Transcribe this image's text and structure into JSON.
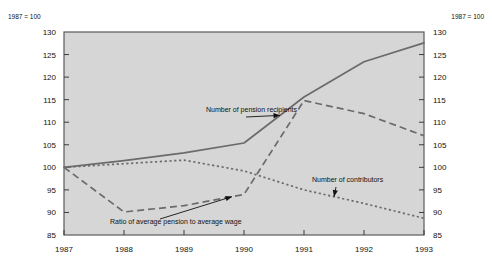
{
  "chart_data": {
    "type": "line",
    "title": "",
    "subtitle": "",
    "xlabel": "",
    "ylabel": "",
    "note_left": "1987 = 100",
    "note_right": "1987 = 100",
    "categories": [
      "1987",
      "1988",
      "1989",
      "1990",
      "1991",
      "1992",
      "1993"
    ],
    "x": [
      1987,
      1988,
      1989,
      1990,
      1991,
      1992,
      1993
    ],
    "ylim": [
      85,
      130
    ],
    "yticks": [
      85,
      90,
      95,
      100,
      105,
      110,
      115,
      120,
      125,
      130
    ],
    "ytick_labels_left": [
      "85",
      "90",
      "95",
      "100",
      "105",
      "110",
      "115",
      "120",
      "125",
      "130"
    ],
    "ytick_labels_right": [
      "85",
      "90",
      "95",
      "100",
      "105",
      "110",
      "115",
      "120",
      "125",
      "130"
    ],
    "grid": false,
    "legend_position": "inline-annotations",
    "series": [
      {
        "name": "Number of pension recipients",
        "style": "solid",
        "color": "#6b6b6b",
        "values": [
          100.0,
          101.5,
          103.2,
          105.4,
          115.6,
          123.4,
          127.6
        ]
      },
      {
        "name": "Ratio of average pension to average wage",
        "style": "dashed",
        "color": "#6b6b6b",
        "values": [
          100.0,
          90.1,
          91.5,
          94.0,
          114.8,
          111.9,
          107.0
        ]
      },
      {
        "name": "Number of contributors",
        "style": "dotted",
        "color": "#6b6b6b",
        "values": [
          100.0,
          100.8,
          101.6,
          99.2,
          95.0,
          92.0,
          88.7
        ]
      }
    ],
    "annotations": [
      {
        "text": "Number of pension recipients",
        "target_series": "Number of pension recipients",
        "target_x": 1990.6
      },
      {
        "text": "Number of contributors",
        "target_series": "Number of contributors",
        "target_x": 1991.5
      },
      {
        "text": "Ratio of average pension to average wage",
        "target_series": "Ratio of average pension to average wage",
        "target_x": 1989.8
      }
    ]
  }
}
